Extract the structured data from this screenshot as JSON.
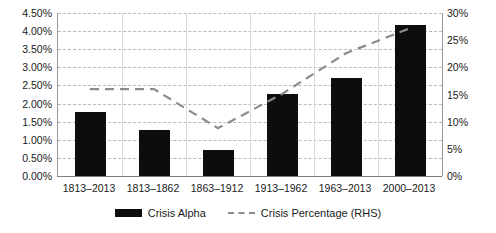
{
  "chart_data": {
    "type": "bar",
    "title": "",
    "subtitle": "",
    "xlabel": "",
    "ylabel": "",
    "grid": true,
    "legend_position": "bottom",
    "categories": [
      "1813–2013",
      "1813–1862",
      "1863–1912",
      "1913–1962",
      "1963–2013",
      "2000–2013"
    ],
    "axes": {
      "left": {
        "label": "",
        "min": 0.0,
        "max": 4.5,
        "step": 0.5,
        "unit": "%",
        "tick_labels": [
          "4.50%",
          "4.00%",
          "3.50%",
          "3.00%",
          "2.50%",
          "2.00%",
          "1.50%",
          "1.00%",
          "0.50%",
          "0.00%"
        ],
        "tick_values": [
          4.5,
          4.0,
          3.5,
          3.0,
          2.5,
          2.0,
          1.5,
          1.0,
          0.5,
          0.0
        ]
      },
      "right": {
        "label": "",
        "min": 0,
        "max": 30,
        "step": 5,
        "unit": "%",
        "tick_labels": [
          "30%",
          "25%",
          "20%",
          "15%",
          "10%",
          "5%",
          "0%"
        ],
        "tick_values": [
          30,
          25,
          20,
          15,
          10,
          5,
          0
        ]
      }
    },
    "series": [
      {
        "name": "Crisis Alpha",
        "render": "bar",
        "axis": "left",
        "color": "#0d0d0d",
        "values": [
          1.77,
          1.27,
          0.72,
          2.26,
          2.7,
          4.17
        ],
        "value_labels": [
          "1.77%",
          "1.27%",
          "0.72%",
          "2.26%",
          "2.70%",
          "4.17%"
        ]
      },
      {
        "name": "Crisis Percentage (RHS)",
        "render": "line",
        "axis": "right",
        "color": "#8c8c8c",
        "style": "dashed",
        "values": [
          16.0,
          16.0,
          8.8,
          15.1,
          22.6,
          27.2
        ],
        "value_labels": [
          "16.0%",
          "16.0%",
          "8.8%",
          "15.1%",
          "22.6%",
          "27.2%"
        ]
      }
    ]
  },
  "legend": {
    "entries": [
      {
        "label": "Crisis Alpha",
        "marker": "filled-bar-swatch"
      },
      {
        "label": "Crisis Percentage (RHS)",
        "marker": "dashed-line-swatch"
      }
    ]
  }
}
